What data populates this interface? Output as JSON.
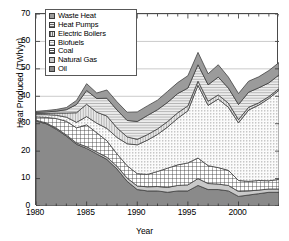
{
  "chart_data": {
    "type": "area",
    "stacked": true,
    "title": "",
    "xlabel": "Year",
    "ylabel": "Heat Produced (TWh/yr)",
    "xlim": [
      1980,
      2004
    ],
    "ylim": [
      0,
      70
    ],
    "xticks": [
      1980,
      1985,
      1990,
      1995,
      2000
    ],
    "yticks": [
      0,
      10,
      20,
      30,
      40,
      50,
      60,
      70
    ],
    "grid": true,
    "grid_axis": "y",
    "legend_position": "top-left",
    "x": [
      1980,
      1981,
      1982,
      1983,
      1984,
      1985,
      1986,
      1987,
      1988,
      1989,
      1990,
      1991,
      1992,
      1993,
      1994,
      1995,
      1996,
      1997,
      1998,
      1999,
      2000,
      2001,
      2002,
      2003,
      2004
    ],
    "series": [
      {
        "name": "Oil",
        "pattern": "solid-dark-gray",
        "color": "#8a8a8a",
        "values": [
          31.0,
          30.0,
          28.0,
          25.5,
          22.5,
          21.0,
          19.0,
          17.0,
          13.5,
          9.0,
          6.0,
          5.5,
          5.5,
          5.0,
          5.5,
          5.5,
          7.5,
          6.0,
          6.0,
          5.5,
          3.5,
          4.0,
          4.5,
          5.0,
          5.0
        ]
      },
      {
        "name": "Natural Gas",
        "pattern": "light-gray",
        "color": "#c9c9c9",
        "values": [
          0.3,
          0.3,
          0.4,
          0.4,
          0.5,
          0.6,
          0.7,
          0.8,
          1.0,
          1.2,
          1.3,
          1.5,
          1.6,
          1.8,
          2.0,
          2.2,
          2.5,
          2.2,
          2.0,
          2.0,
          1.8,
          1.5,
          1.3,
          1.2,
          1.2
        ]
      },
      {
        "name": "Coal",
        "pattern": "crosshatch",
        "color": "#ffffff",
        "values": [
          1.2,
          2.0,
          3.5,
          5.0,
          5.5,
          8.0,
          7.0,
          6.0,
          4.5,
          4.5,
          4.5,
          4.5,
          5.5,
          7.0,
          7.5,
          8.0,
          7.5,
          6.5,
          6.0,
          5.5,
          4.0,
          3.5,
          3.5,
          3.0,
          3.5
        ]
      },
      {
        "name": "Biofuels",
        "pattern": "stipple-dots",
        "color": "#f2f2f2",
        "values": [
          0.8,
          1.0,
          1.2,
          1.5,
          2.0,
          3.0,
          3.5,
          4.5,
          6.0,
          8.0,
          10.5,
          12.5,
          13.5,
          15.0,
          17.0,
          19.0,
          26.5,
          22.0,
          25.0,
          23.0,
          21.0,
          26.0,
          27.5,
          30.0,
          32.5
        ]
      },
      {
        "name": "Electric Boilers",
        "pattern": "vertical-lines",
        "color": "#d8d8d8",
        "values": [
          0.4,
          0.5,
          0.8,
          1.5,
          3.5,
          4.5,
          4.0,
          4.5,
          3.5,
          2.5,
          2.0,
          2.0,
          2.0,
          2.0,
          2.0,
          1.8,
          1.5,
          1.5,
          1.5,
          1.5,
          1.2,
          1.0,
          0.8,
          0.7,
          0.6
        ]
      },
      {
        "name": "Heat Pumps",
        "pattern": "horizontal-lines",
        "color": "#e3e3e3",
        "values": [
          0.4,
          0.5,
          0.7,
          1.2,
          3.0,
          5.0,
          5.0,
          6.5,
          6.5,
          6.0,
          6.5,
          7.0,
          7.0,
          7.0,
          7.0,
          6.5,
          6.0,
          6.0,
          6.5,
          5.5,
          5.5,
          5.5,
          5.5,
          5.0,
          5.0
        ]
      },
      {
        "name": "Waste Heat",
        "pattern": "solid-mid-gray",
        "color": "#9b9b9b",
        "values": [
          0.4,
          0.5,
          0.6,
          0.8,
          1.5,
          2.5,
          2.0,
          3.0,
          3.0,
          3.0,
          3.5,
          3.5,
          3.5,
          4.0,
          4.0,
          4.5,
          4.5,
          4.0,
          4.5,
          4.0,
          4.0,
          4.0,
          4.0,
          4.5,
          4.5
        ]
      }
    ]
  },
  "axes": {
    "ylabel": "Heat Produced (TWh/yr)",
    "xlabel": "Year",
    "yticks": [
      "70",
      "60",
      "50",
      "40",
      "30",
      "20",
      "10",
      "0"
    ],
    "xticks": [
      "1980",
      "1985",
      "1990",
      "1995",
      "2000"
    ]
  },
  "legend": {
    "items": [
      {
        "label": "Waste Heat"
      },
      {
        "label": "Heat Pumps"
      },
      {
        "label": "Electric Boilers"
      },
      {
        "label": "Biofuels"
      },
      {
        "label": "Coal"
      },
      {
        "label": "Natural Gas"
      },
      {
        "label": "Oil"
      }
    ]
  }
}
